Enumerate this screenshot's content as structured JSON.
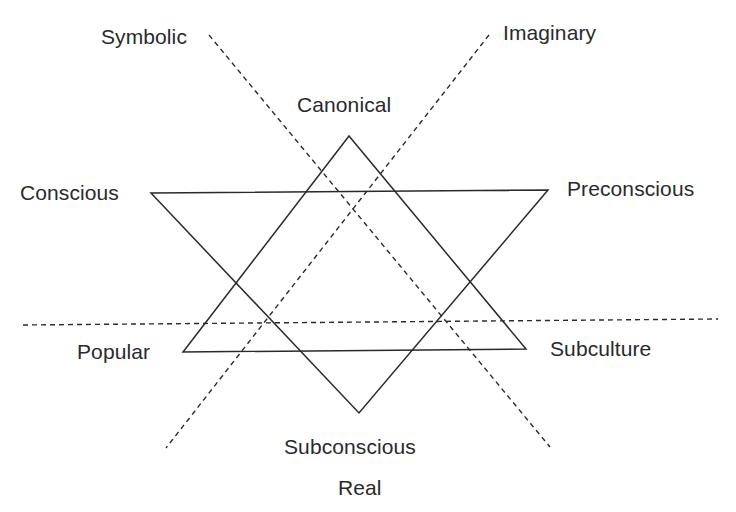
{
  "diagram": {
    "type": "star-of-david-with-axes",
    "axes": [
      {
        "id": "symbolic",
        "label": "Symbolic",
        "style": "dashed",
        "from": [
          209,
          35
        ],
        "to": [
          550,
          447
        ]
      },
      {
        "id": "imaginary",
        "label": "Imaginary",
        "style": "dashed",
        "from": [
          489,
          35
        ],
        "to": [
          166,
          448
        ]
      },
      {
        "id": "horizontal",
        "label": "",
        "style": "dashed",
        "from": [
          23,
          325
        ],
        "to": [
          718,
          319
        ]
      }
    ],
    "triangles": [
      {
        "id": "upward",
        "vertices": {
          "Canonical": [
            349,
            136
          ],
          "Popular": [
            183,
            352
          ],
          "Subculture": [
            526,
            349
          ]
        }
      },
      {
        "id": "downward",
        "vertices": {
          "Conscious": [
            151,
            193
          ],
          "Preconscious": [
            548,
            190
          ],
          "Subconscious": [
            359,
            413
          ]
        }
      }
    ],
    "line_color": "#2a2a2a",
    "background": "#ffffff"
  },
  "labels": {
    "symbolic": "Symbolic",
    "imaginary": "Imaginary",
    "canonical": "Canonical",
    "conscious": "Conscious",
    "preconscious": "Preconscious",
    "popular": "Popular",
    "subculture": "Subculture",
    "subconscious": "Subconscious",
    "real": "Real"
  }
}
